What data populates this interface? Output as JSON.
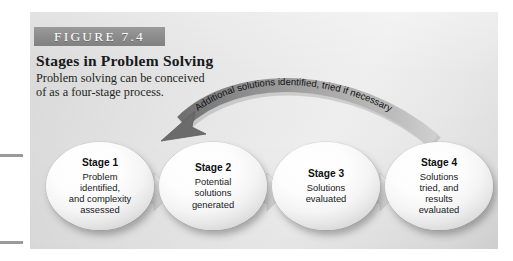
{
  "figure": {
    "band_label": "FIGURE 7.4",
    "title": "Stages in Problem Solving",
    "subtitle_line_1": "Problem solving can be conceived",
    "subtitle_line_2": "of as a four-stage process.",
    "feedback_arrow_label": "Additional solutions identified, tried if necessary",
    "colors": {
      "band_gray": "#8c8c8c",
      "panel_gray": "#e6e6e6",
      "oval_white": "#ffffff",
      "flow_arrow_gray": "#dcdcdc",
      "feedback_arrow_gray": "#8f8f8f",
      "feedback_arrow_dark": "#6d6d6d",
      "text_black": "#101214"
    }
  },
  "stages": [
    {
      "heading": "Stage 1",
      "lines": [
        "Problem",
        "identified,",
        "and complexity",
        "assessed"
      ]
    },
    {
      "heading": "Stage 2",
      "lines": [
        "Potential",
        "solutions",
        "generated"
      ]
    },
    {
      "heading": "Stage 3",
      "lines": [
        "Solutions",
        "evaluated"
      ]
    },
    {
      "heading": "Stage 4",
      "lines": [
        "Solutions",
        "tried, and",
        "results",
        "evaluated"
      ]
    }
  ]
}
